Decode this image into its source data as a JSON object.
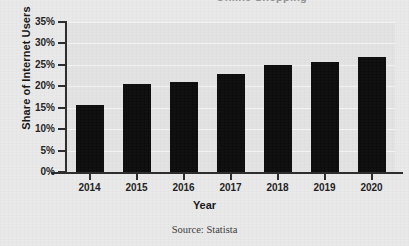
{
  "figure": {
    "title_partial": "Online Shopping",
    "source_note": "Source: Statista"
  },
  "chart_data": {
    "type": "bar",
    "title": "",
    "xlabel": "Year",
    "ylabel": "Share of Internet Users",
    "categories": [
      "2014",
      "2015",
      "2016",
      "2017",
      "2018",
      "2019",
      "2020"
    ],
    "values": [
      15.6,
      20.6,
      20.9,
      22.9,
      24.9,
      25.7,
      26.9
    ],
    "ylim": [
      0,
      35
    ],
    "ytick_labels": [
      "0%",
      "5%",
      "10%",
      "15%",
      "20%",
      "25%",
      "30%",
      "35%"
    ],
    "ytick_values": [
      0,
      5,
      10,
      15,
      20,
      25,
      30,
      35
    ],
    "grid": true,
    "legend": "none",
    "bar_color": "#0b0b0b",
    "plot_background": "#e3e3e3",
    "page_background": "#e9e9e9"
  }
}
